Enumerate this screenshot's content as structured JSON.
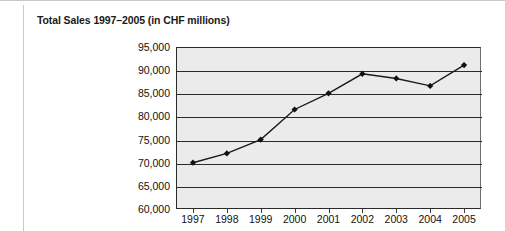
{
  "chart_data": {
    "type": "line",
    "title": "Total Sales 1997–2005 (in CHF millions)",
    "xlabel": "",
    "ylabel": "",
    "categories": [
      "1997",
      "1998",
      "1999",
      "2000",
      "2001",
      "2002",
      "2003",
      "2004",
      "2005"
    ],
    "values": [
      70000,
      72000,
      75000,
      81500,
      85000,
      89200,
      88200,
      86600,
      91100
    ],
    "series": [
      {
        "name": "Total Sales",
        "values": [
          70000,
          72000,
          75000,
          81500,
          85000,
          89200,
          88200,
          86600,
          91100
        ]
      }
    ],
    "ylim": [
      60000,
      95000
    ],
    "ytick_labels": [
      "95,000",
      "90,000",
      "85,000",
      "80,000",
      "75,000",
      "70,000",
      "65,000",
      "60,000"
    ],
    "ytick_values": [
      95000,
      90000,
      85000,
      80000,
      75000,
      70000,
      65000,
      60000
    ],
    "grid": true,
    "legend": "none",
    "marker": "diamond",
    "line_color": "#1a1a1a",
    "marker_color": "#111111",
    "plot_background": "#ebebeb",
    "gridline_color": "#2b2b2b",
    "figure_background": "#ffffff"
  }
}
